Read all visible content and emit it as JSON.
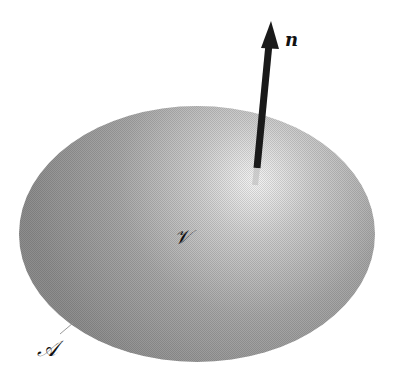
{
  "diagram": {
    "type": "surface-with-normal",
    "volume_label": "𝒱",
    "surface_label": "𝒜",
    "normal_label": "n",
    "colors": {
      "background": "#ffffff",
      "surface_dark": "#8a8a8a",
      "surface_light": "#f2f2f2",
      "arrow": "#1a1a1a"
    }
  }
}
